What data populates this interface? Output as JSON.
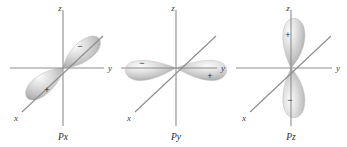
{
  "figure": {
    "background_color": "#ffffff",
    "axis_color": "#8d8d8d",
    "lobe_fill_light": "#f2f2f2",
    "lobe_fill_mid": "#c9c9c9",
    "lobe_fill_dark": "#9a9a9a",
    "label_color": "#3d3d3d"
  },
  "panels": [
    {
      "id": "px",
      "name": "Px",
      "axes": {
        "z": "z",
        "y": "y",
        "x": "x"
      },
      "lobes": [
        {
          "sign": "−",
          "direction": "upper-right"
        },
        {
          "sign": "+",
          "direction": "lower-left"
        }
      ],
      "orientation": "along-x-axis"
    },
    {
      "id": "py",
      "name": "Py",
      "axes": {
        "z": "z",
        "y": "y",
        "x": "x"
      },
      "lobes": [
        {
          "sign": "−",
          "direction": "left"
        },
        {
          "sign": "+",
          "direction": "right"
        }
      ],
      "orientation": "along-y-axis"
    },
    {
      "id": "pz",
      "name": "Pz",
      "axes": {
        "z": "z",
        "y": "y",
        "x": "x"
      },
      "lobes": [
        {
          "sign": "+",
          "direction": "up"
        },
        {
          "sign": "−",
          "direction": "down"
        }
      ],
      "orientation": "along-z-axis"
    }
  ]
}
